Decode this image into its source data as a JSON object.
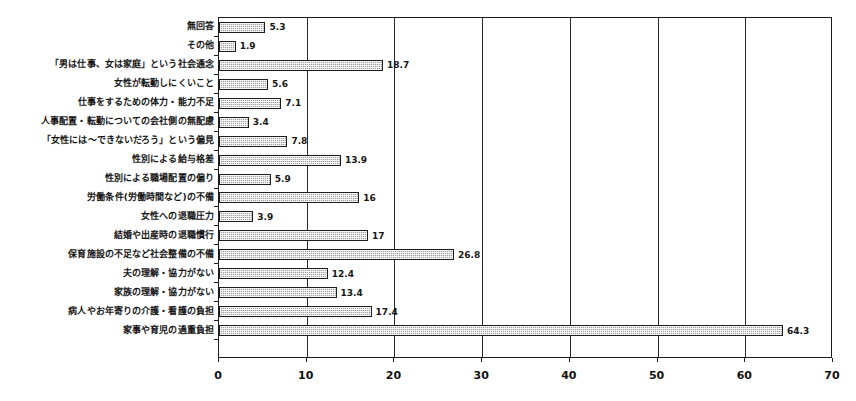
{
  "chart_data": {
    "type": "bar",
    "orientation": "horizontal",
    "title": "",
    "subtitle": "",
    "xlabel": "",
    "ylabel": "",
    "xlim": [
      0,
      70
    ],
    "xticks": [
      0,
      10,
      20,
      30,
      40,
      50,
      60,
      70
    ],
    "xtick_labels": [
      "0",
      "10",
      "20",
      "30",
      "40",
      "50",
      "60",
      "70"
    ],
    "grid": true,
    "grid_axis": "x",
    "legend": false,
    "legend_position": "none",
    "bar_fill_color": "#9d9d9d",
    "bar_border_color": "#1d1d1d",
    "axis_color": "#1b1b1b",
    "text_color": "#161616",
    "categories": [
      "無回答",
      "その他",
      "「男は仕事、女は家庭」という社会通念",
      "女性が転勤しにくいこと",
      "仕事をするための体力・能力不足",
      "人事配置・転勤についての会社側の無配慮",
      "「女性には～できないだろう」という偏見",
      "性別による給与格差",
      "性別による職場配置の偏り",
      "労働条件(労働時間など)の不備",
      "女性への退職圧力",
      "結婚や出産時の退職慣行",
      "保育施設の不足など社会整備の不備",
      "夫の理解・協力がない",
      "家族の理解・協力がない",
      "病人やお年寄りの介護・看護の負担",
      "家事や育児の過重負担"
    ],
    "values": [
      5.3,
      1.9,
      18.7,
      5.6,
      7.1,
      3.4,
      7.8,
      13.9,
      5.9,
      16,
      3.9,
      17,
      26.8,
      12.4,
      13.4,
      17.4,
      64.3
    ],
    "value_labels": [
      "5.3",
      "1.9",
      "18.7",
      "5.6",
      "7.1",
      "3.4",
      "7.8",
      "13.9",
      "5.9",
      "16",
      "3.9",
      "17",
      "26.8",
      "12.4",
      "13.4",
      "17.4",
      "64.3"
    ]
  }
}
